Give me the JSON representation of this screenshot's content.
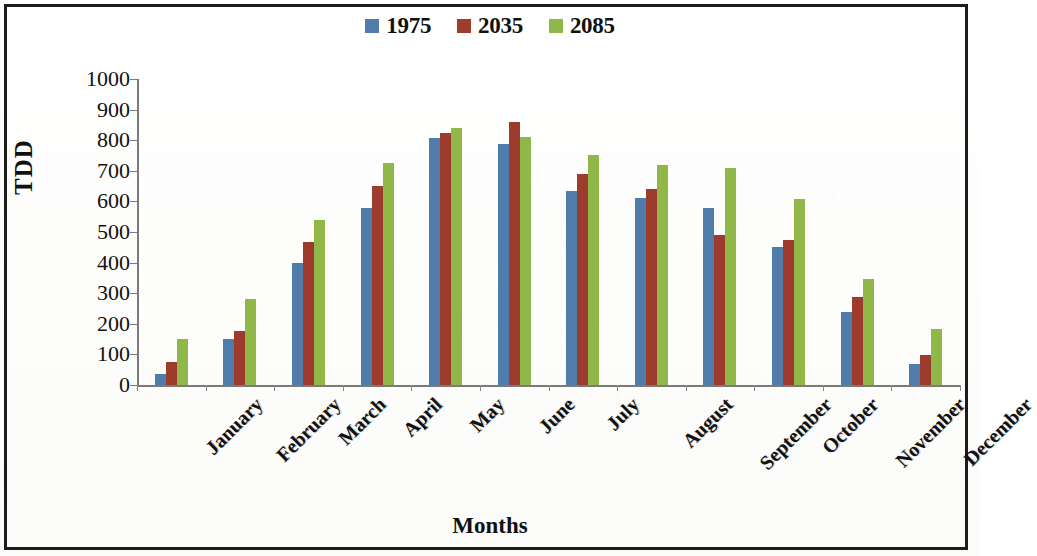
{
  "chart_data": {
    "type": "bar",
    "title": "",
    "xlabel": "Months",
    "ylabel": "TDD",
    "categories": [
      "January",
      "February",
      "March",
      "April",
      "May",
      "June",
      "July",
      "August",
      "September",
      "October",
      "November",
      "December"
    ],
    "series": [
      {
        "name": "1975",
        "color": "#4f7cab",
        "values": [
          35,
          150,
          400,
          578,
          808,
          788,
          635,
          610,
          578,
          452,
          240,
          68
        ]
      },
      {
        "name": "2035",
        "color": "#9d3b2d",
        "values": [
          75,
          178,
          468,
          652,
          825,
          860,
          690,
          640,
          490,
          475,
          288,
          98
        ]
      },
      {
        "name": "2085",
        "color": "#8fb848",
        "values": [
          150,
          282,
          538,
          725,
          840,
          810,
          752,
          718,
          708,
          608,
          345,
          182
        ]
      }
    ],
    "ylim": [
      0,
      1000
    ],
    "yticks": [
      0,
      100,
      200,
      300,
      400,
      500,
      600,
      700,
      800,
      900,
      1000
    ],
    "ytick_labels": [
      "0",
      "100",
      "200",
      "300",
      "400",
      "500",
      "600",
      "700",
      "800",
      "900",
      "1000"
    ],
    "grid": false,
    "legend_position": "top-center"
  },
  "legend": {
    "items": [
      {
        "label": "1975",
        "color": "#4f7cab",
        "swatch_name": "legend-swatch-1975"
      },
      {
        "label": "2035",
        "color": "#9d3b2d",
        "swatch_name": "legend-swatch-2035"
      },
      {
        "label": "2085",
        "color": "#8fb848",
        "swatch_name": "legend-swatch-2085"
      }
    ]
  },
  "axes": {
    "y_title": "TDD",
    "x_title": "Months"
  }
}
